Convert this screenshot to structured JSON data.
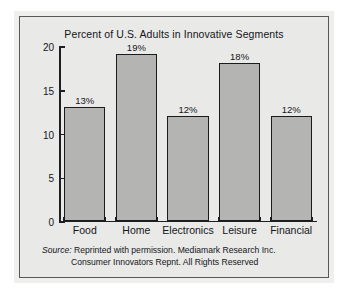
{
  "chart_data": {
    "type": "bar",
    "title": "Percent of U.S. Adults in Innovative Segments",
    "xlabel": "",
    "ylabel": "",
    "categories": [
      "Food",
      "Home",
      "Electronics",
      "Leisure",
      "Financial"
    ],
    "values": [
      13,
      19,
      12,
      18,
      12
    ],
    "value_labels": [
      "13%",
      "19%",
      "12%",
      "18%",
      "12%"
    ],
    "ylim": [
      0,
      20
    ],
    "yticks": [
      0,
      5,
      10,
      15,
      20
    ],
    "ytick_labels": [
      "0",
      "5",
      "10",
      "15",
      "20"
    ],
    "grid": false,
    "legend": false,
    "bar_color": "#b4b4b2",
    "bar_edge_color": "#191b1e",
    "background_color": "#e9e9e7",
    "text_color": "#14161a"
  },
  "source": {
    "label": "Source:",
    "line1": "Reprinted with permission. Mediamark Research Inc.",
    "line2": "Consumer Innovators Repnt. All Rights Reserved"
  }
}
